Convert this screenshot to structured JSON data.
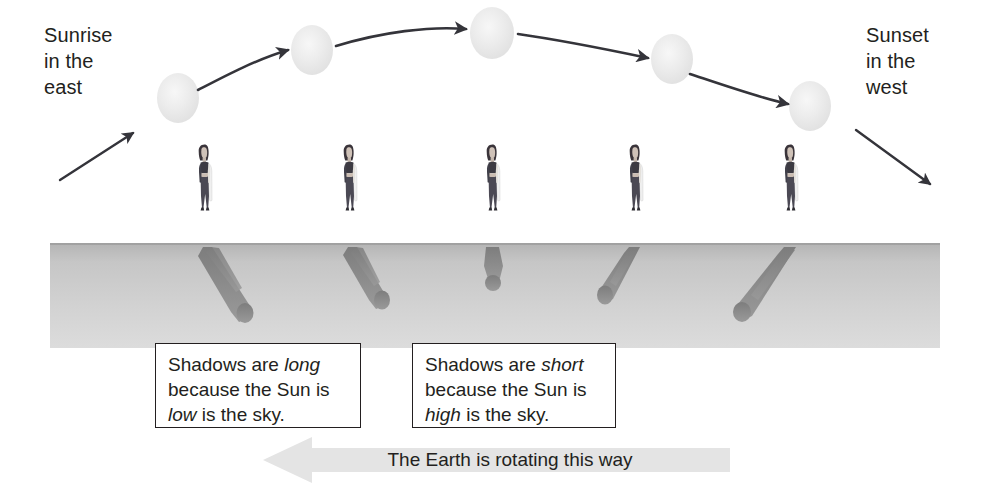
{
  "diagram": {
    "sunrise_label": "Sunrise\nin the\neast",
    "sunset_label": "Sunset\nin the\nwest",
    "rotation_caption": "The Earth is rotating this way",
    "callouts": [
      {
        "id": "long-shadows",
        "line1_pre": "Shadows are ",
        "line1_em": "long",
        "line2": "because the Sun is",
        "line3_em": "low",
        "line3_post": " is the sky."
      },
      {
        "id": "short-shadows",
        "line1_pre": "Shadows are ",
        "line1_em": "short",
        "line2": "because the Sun is",
        "line3_em": "high",
        "line3_post": " is the sky."
      }
    ],
    "colors": {
      "ink": "#231f20",
      "ground_top": "#b9b9b9",
      "ground_bottom": "#d8d8d8",
      "sun_fill": "#ebebeb",
      "shadow": "#8c8c8c",
      "rotation_arrow": "#e2e2e2",
      "figure_dark": "#4a4a52",
      "figure_light": "#e8e8e8"
    },
    "suns": [
      {
        "index": 1,
        "cx": 178,
        "cy": 98,
        "r": 25
      },
      {
        "index": 2,
        "cx": 312,
        "cy": 50,
        "r": 25
      },
      {
        "index": 3,
        "cx": 492,
        "cy": 33,
        "r": 26
      },
      {
        "index": 4,
        "cx": 672,
        "cy": 59,
        "r": 25
      },
      {
        "index": 5,
        "cx": 810,
        "cy": 106,
        "r": 25
      }
    ],
    "figures": [
      {
        "index": 1,
        "x": 205,
        "shadow": "long-right"
      },
      {
        "index": 2,
        "x": 350,
        "shadow": "medium-right"
      },
      {
        "index": 3,
        "x": 492,
        "shadow": "short-down"
      },
      {
        "index": 4,
        "x": 635,
        "shadow": "medium-left"
      },
      {
        "index": 5,
        "x": 790,
        "shadow": "long-left"
      }
    ],
    "ground": {
      "x": 50,
      "y": 243,
      "width": 890,
      "height": 105
    }
  }
}
